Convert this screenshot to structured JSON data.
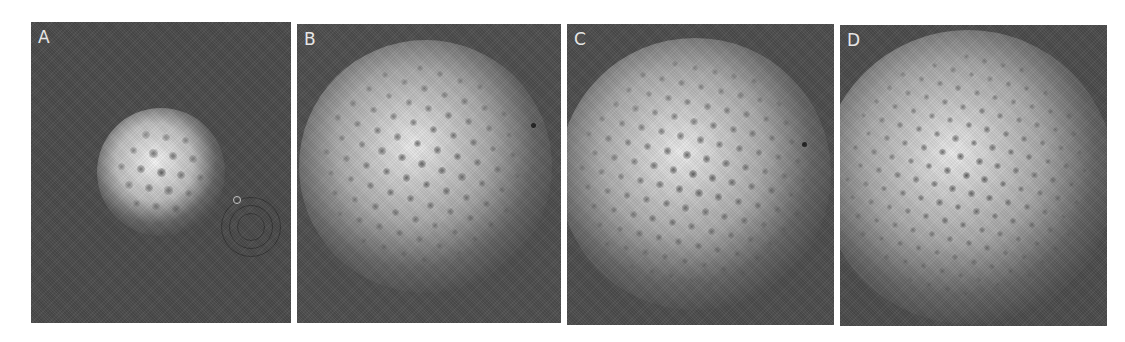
{
  "figure": {
    "background": "#ffffff",
    "panels": [
      {
        "id": "A",
        "label": "A",
        "box": {
          "x": 31,
          "y": 22,
          "w": 260,
          "h": 301
        },
        "background": "#4b4b4b",
        "glow": {
          "cx": 130,
          "cy": 150,
          "r": 56,
          "core": "#f4f4f4",
          "mid": "#bdbdbd"
        },
        "lattice": {
          "cx": 130,
          "cy": 150,
          "spacing": 20,
          "radius": 52,
          "angle": 8,
          "dotSize": 9
        },
        "artifacts": [
          {
            "type": "ring",
            "cx": 220,
            "cy": 205,
            "r": 14
          },
          {
            "type": "ring",
            "cx": 220,
            "cy": 205,
            "r": 22
          },
          {
            "type": "ring",
            "cx": 220,
            "cy": 205,
            "r": 30
          },
          {
            "type": "defect-light",
            "cx": 206,
            "cy": 178,
            "r": 4
          }
        ]
      },
      {
        "id": "B",
        "label": "B",
        "box": {
          "x": 297,
          "y": 24,
          "w": 264,
          "h": 299
        },
        "background": "#4e4e4e",
        "glow": {
          "cx": 128,
          "cy": 142,
          "r": 110,
          "core": "#ececec",
          "mid": "#a9a9a9"
        },
        "lattice": {
          "cx": 125,
          "cy": 140,
          "spacing": 21,
          "radius": 100,
          "angle": 18,
          "dotSize": 8
        },
        "artifacts": [
          {
            "type": "defect",
            "cx": 236,
            "cy": 101,
            "r": 2.5
          }
        ]
      },
      {
        "id": "C",
        "label": "C",
        "box": {
          "x": 567,
          "y": 24,
          "w": 267,
          "h": 301
        },
        "background": "#4d4d4d",
        "glow": {
          "cx": 128,
          "cy": 150,
          "r": 118,
          "core": "#ececec",
          "mid": "#aaaaaa"
        },
        "lattice": {
          "cx": 126,
          "cy": 150,
          "spacing": 20,
          "radius": 112,
          "angle": 12,
          "dotSize": 8
        },
        "artifacts": [
          {
            "type": "defect",
            "cx": 237,
            "cy": 120,
            "r": 2.5
          }
        ]
      },
      {
        "id": "D",
        "label": "D",
        "box": {
          "x": 840,
          "y": 25,
          "w": 267,
          "h": 301
        },
        "background": "#4c4c4c",
        "glow": {
          "cx": 128,
          "cy": 152,
          "r": 128,
          "core": "#ebebeb",
          "mid": "#a8a8a8"
        },
        "lattice": {
          "cx": 126,
          "cy": 150,
          "spacing": 19,
          "radius": 122,
          "angle": 14,
          "dotSize": 7
        },
        "artifacts": []
      }
    ]
  }
}
